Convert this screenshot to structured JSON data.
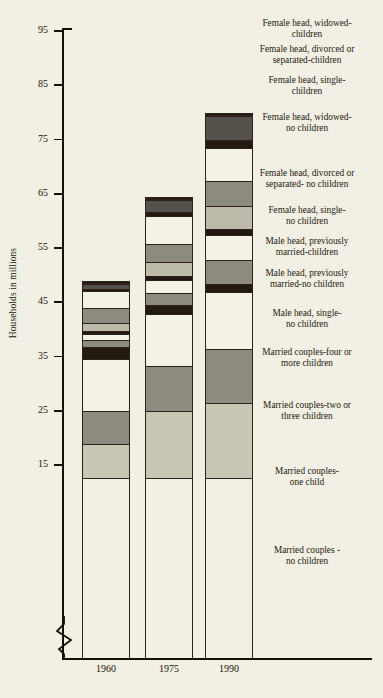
{
  "chart_data": {
    "type": "bar",
    "title": "",
    "xlabel": "",
    "ylabel": "Households in millions",
    "categories": [
      "1960",
      "1975",
      "1990"
    ],
    "ylim": [
      12,
      96
    ],
    "y_ticks": [
      15,
      25,
      35,
      45,
      55,
      65,
      75,
      85,
      95
    ],
    "axis_break": true,
    "grid": false,
    "legend_position": "right",
    "stacked": true,
    "series": [
      {
        "name": "Married couples-no children",
        "color": "#c9c6b6",
        "values": [
          6.5,
          12.5,
          14.0
        ]
      },
      {
        "name": "Married couples-one child",
        "color": "#8d8b80",
        "values": [
          6.1,
          8.4,
          10.0
        ]
      },
      {
        "name": "Married couples-two or three children",
        "color": "#f4f1e6",
        "values": [
          9.6,
          9.6,
          10.6
        ]
      },
      {
        "name": "Married couples-four or more children",
        "color": "#221a10",
        "values": [
          2.2,
          1.6,
          1.4
        ]
      },
      {
        "name": "Male head, single-no children",
        "color": "#8d8b80",
        "values": [
          1.3,
          2.3,
          4.5
        ]
      },
      {
        "name": "Male head, previously married-no children",
        "color": "#f4f1e6",
        "values": [
          1.1,
          2.4,
          4.5
        ]
      },
      {
        "name": "Male head, previously married-children",
        "color": "#221a10",
        "values": [
          0.5,
          0.6,
          1.2
        ]
      },
      {
        "name": "Female head, single-no children",
        "color": "#bdbaab",
        "values": [
          1.6,
          2.6,
          4.1
        ]
      },
      {
        "name": "Female head, divorced or separated- no children",
        "color": "#8d8b80",
        "values": [
          2.6,
          3.3,
          4.7
        ]
      },
      {
        "name": "Female head, widowed-no children",
        "color": "#f4f1e6",
        "values": [
          3.3,
          5.2,
          6.0
        ]
      },
      {
        "name": "Female head, single-children",
        "color": "#221a10",
        "values": [
          0.3,
          0.7,
          1.6
        ]
      },
      {
        "name": "Female head, divorced or separated-children",
        "color": "#55504a",
        "values": [
          1.0,
          2.3,
          4.3
        ]
      },
      {
        "name": "Female head, widowed-children",
        "color": "#2e1a18",
        "values": [
          0.5,
          0.6,
          0.6
        ]
      }
    ],
    "totals": [
      52.8,
      72.1,
      93.3
    ]
  },
  "axis": {
    "y_title": "Households in millions",
    "y_tick_labels": [
      "95",
      "85",
      "75",
      "65",
      "55",
      "45",
      "35",
      "25",
      "15"
    ],
    "x_tick_labels": [
      "1960",
      "1975",
      "1990"
    ]
  },
  "legend": {
    "entries": [
      {
        "line1": "Female head, widowed-",
        "line2": "children"
      },
      {
        "line1": "Female head, divorced or",
        "line2": "separated-children"
      },
      {
        "line1": "Female head, single-",
        "line2": "children"
      },
      {
        "line1": "Female head, widowed-",
        "line2": "no children"
      },
      {
        "line1": "Female head, divorced or",
        "line2": "separated- no children"
      },
      {
        "line1": "Female head, single-",
        "line2": "no children"
      },
      {
        "line1": "Male head, previously",
        "line2": "married-children"
      },
      {
        "line1": "Male head, previously",
        "line2": "married-no children"
      },
      {
        "line1": "Male head, single-",
        "line2": "no children"
      },
      {
        "line1": "Married couples-four or",
        "line2": "more children"
      },
      {
        "line1": "Married couples-two or",
        "line2": "three children"
      },
      {
        "line1": "Married couples-",
        "line2": "one child"
      },
      {
        "line1": "Married couples -",
        "line2": "no children"
      }
    ]
  },
  "colors": {
    "background": "#f2efe4",
    "ink": "#171008",
    "light_gray": "#c9c6b6",
    "mid_gray": "#8d8b80",
    "pale": "#f4f1e6",
    "dark": "#221a10"
  }
}
